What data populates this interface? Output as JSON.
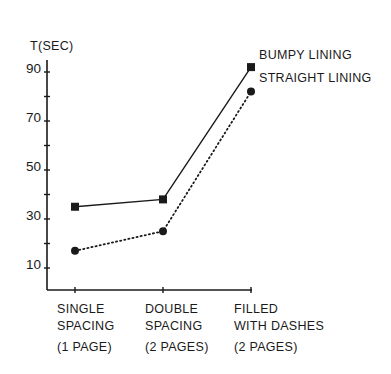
{
  "chart_data": {
    "type": "line",
    "title": "",
    "ylabel": "T(SEC)",
    "xlabel": "",
    "ylim": [
      0,
      100
    ],
    "yticks_labeled": [
      10,
      30,
      50,
      70,
      90
    ],
    "yticks_minor": [
      20,
      40,
      60,
      80
    ],
    "grid": false,
    "legend_position": "inline-right",
    "categories": [
      [
        "SINGLE",
        "SPACING",
        "(1 PAGE)"
      ],
      [
        "DOUBLE",
        "SPACING",
        "(2 PAGES)"
      ],
      [
        "FILLED",
        "WITH DASHES",
        "(2 PAGES)"
      ]
    ],
    "series": [
      {
        "name": "BUMPY LINING",
        "marker": "square",
        "line": "solid",
        "values": [
          35,
          38,
          92
        ]
      },
      {
        "name": "STRAIGHT LINING",
        "marker": "circle",
        "line": "dotted",
        "values": [
          17,
          25,
          82
        ]
      }
    ],
    "colors": {
      "ink": "#1a1a1a",
      "background": "#ffffff"
    }
  }
}
